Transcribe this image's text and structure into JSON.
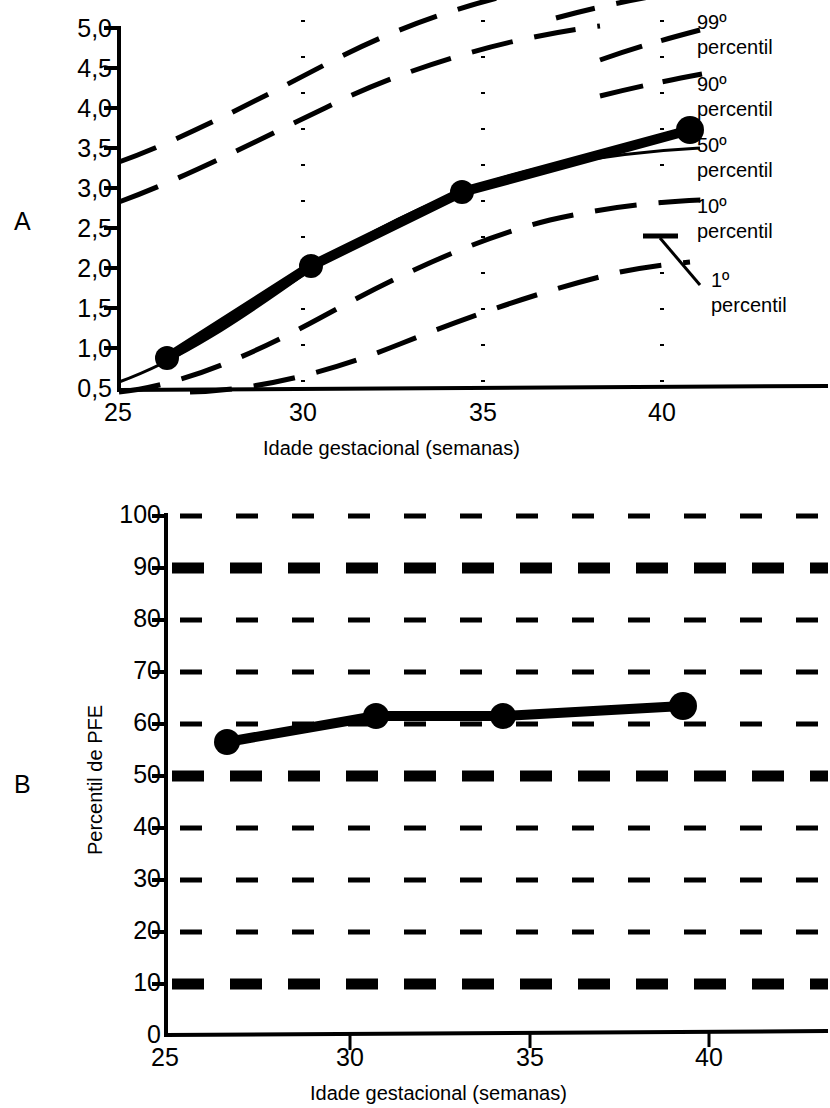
{
  "figure": {
    "panels": [
      {
        "id": "A",
        "letter": "A",
        "xlabel": "Idade gestacional (semanas)",
        "ylabel": "",
        "xticks": [
          "25",
          "30",
          "35",
          "40"
        ],
        "yticks": [
          "5,0",
          "4,5",
          "4,0",
          "3,5",
          "3,0",
          "2,5",
          "2,0",
          "1,5",
          "1,0",
          "0,5"
        ],
        "legend": [
          "99º percentil",
          "90º percentil",
          "50º percentil",
          "10º percentil",
          "1º percentil"
        ],
        "legend_lines": [
          {
            "rank": "99º",
            "word": "percentil"
          },
          {
            "rank": "90º",
            "word": "percentil"
          },
          {
            "rank": "50º",
            "word": "percentil"
          },
          {
            "rank": "10º",
            "word": "percentil"
          },
          {
            "rank": "1º",
            "word": "percentil"
          }
        ]
      },
      {
        "id": "B",
        "letter": "B",
        "xlabel": "Idade gestacional (semanas)",
        "ylabel": "Percentil de PFE",
        "xticks": [
          "25",
          "30",
          "35",
          "40"
        ],
        "yticks": [
          "100",
          "90",
          "80",
          "70",
          "60",
          "50",
          "40",
          "30",
          "20",
          "10",
          "0"
        ]
      }
    ]
  },
  "chart_data": [
    {
      "type": "line",
      "panel": "A",
      "title": "",
      "xlabel": "Idade gestacional (semanas)",
      "ylabel": "",
      "xlim": [
        25,
        41.5
      ],
      "ylim": [
        0.5,
        5.0
      ],
      "xticks": [
        25,
        30,
        35,
        40
      ],
      "yticks": [
        0.5,
        1.0,
        1.5,
        2.0,
        2.5,
        3.0,
        3.5,
        4.0,
        4.5,
        5.0
      ],
      "grid": "vertical-dotted at 30, 35, 40",
      "legend_position": "right",
      "series": [
        {
          "name": "Paciente (PFE)",
          "style": "solid-thick-with-markers",
          "x": [
            26.5,
            31.5,
            35.7,
            40.5
          ],
          "y": [
            0.95,
            2.05,
            3.0,
            3.8
          ]
        },
        {
          "name": "99º percentil",
          "style": "dashed",
          "x": [
            25,
            27,
            29,
            31,
            33,
            35,
            37,
            39,
            41
          ],
          "y": [
            1.65,
            2.15,
            2.7,
            3.3,
            3.9,
            4.45,
            4.85,
            5.1,
            5.25
          ]
        },
        {
          "name": "90º percentil",
          "style": "dashed",
          "x": [
            25,
            27,
            29,
            31,
            33,
            35,
            37,
            39,
            41
          ],
          "y": [
            1.15,
            1.55,
            2.0,
            2.5,
            3.0,
            3.5,
            3.9,
            4.2,
            4.35
          ]
        },
        {
          "name": "50º percentil",
          "style": "solid-thin",
          "x": [
            25,
            27,
            29,
            31,
            33,
            35,
            37,
            39,
            41
          ],
          "y": [
            0.62,
            0.95,
            1.35,
            1.8,
            2.3,
            2.8,
            3.2,
            3.5,
            3.62
          ]
        },
        {
          "name": "10º percentil",
          "style": "dashed",
          "x": [
            25,
            27,
            29,
            31,
            33,
            35,
            37,
            39,
            41
          ],
          "y": [
            0.5,
            0.65,
            0.95,
            1.3,
            1.7,
            2.1,
            2.45,
            2.7,
            2.82
          ]
        },
        {
          "name": "1º percentil",
          "style": "dashed",
          "x": [
            26,
            28,
            30,
            32,
            34,
            36,
            38,
            40,
            41
          ],
          "y": [
            0.5,
            0.5,
            0.55,
            0.8,
            1.1,
            1.4,
            1.65,
            1.85,
            1.92
          ]
        }
      ]
    },
    {
      "type": "line",
      "panel": "B",
      "title": "",
      "xlabel": "Idade gestacional (semanas)",
      "ylabel": "Percentil de PFE",
      "xlim": [
        25,
        41.5
      ],
      "ylim": [
        0,
        100
      ],
      "xticks": [
        25,
        30,
        35,
        40
      ],
      "yticks": [
        0,
        10,
        20,
        30,
        40,
        50,
        60,
        70,
        80,
        90,
        100
      ],
      "grid": "horizontal-dashed at every 10; bold at 10, 50, 90",
      "legend_position": "none",
      "series": [
        {
          "name": "Percentil de PFE do paciente",
          "style": "solid-thick-with-markers",
          "x": [
            26.7,
            32.0,
            35.6,
            40.6
          ],
          "y": [
            57,
            62,
            62,
            64
          ]
        }
      ],
      "reference_lines": [
        {
          "value": 90,
          "style": "bold-dashed"
        },
        {
          "value": 50,
          "style": "bold-dashed"
        },
        {
          "value": 10,
          "style": "bold-dashed"
        },
        {
          "value": 100,
          "style": "thin-dashed"
        },
        {
          "value": 80,
          "style": "thin-dashed"
        },
        {
          "value": 70,
          "style": "thin-dashed"
        },
        {
          "value": 60,
          "style": "thin-dashed"
        },
        {
          "value": 40,
          "style": "thin-dashed"
        },
        {
          "value": 30,
          "style": "thin-dashed"
        },
        {
          "value": 20,
          "style": "thin-dashed"
        }
      ]
    }
  ]
}
